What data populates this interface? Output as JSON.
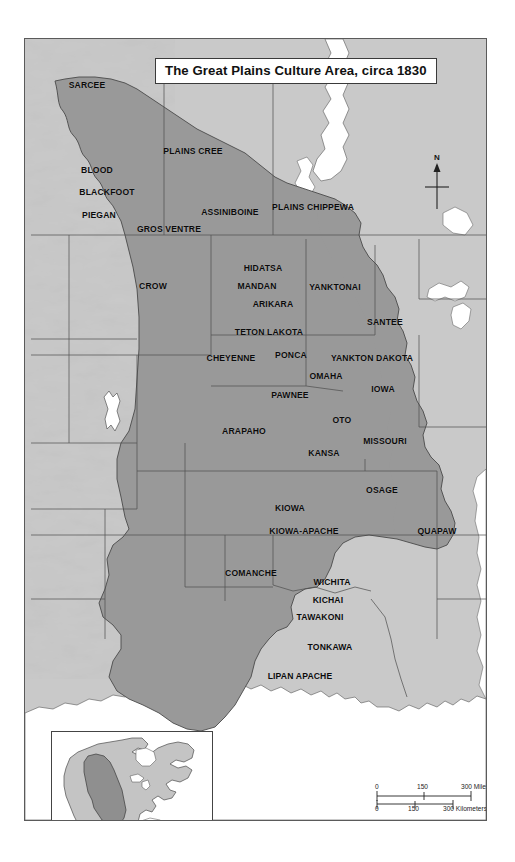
{
  "map": {
    "title": "The Great Plains Culture Area, circa 1830",
    "compass": {
      "north_label": "N",
      "icon": "north-arrow-icon"
    },
    "colors": {
      "culture_area_fill": "#999999",
      "land_fill": "#c9c9c9",
      "water_fill": "#ffffff",
      "border_stroke": "#5a5a5a",
      "label_text": "#0b0b0b",
      "inset_highlight": "#8f8f8f"
    },
    "scale_bar": {
      "miles": {
        "unit": "Miles",
        "ticks": [
          "0",
          "150",
          "300"
        ],
        "label": "300 Miles"
      },
      "kilometers": {
        "unit": "Kilometers",
        "ticks": [
          "0",
          "150",
          "300"
        ],
        "label": "300 Kilometers"
      }
    },
    "inset": {
      "name": "north-america-locator",
      "description": "North America locator with Great Plains highlighted"
    },
    "tribes": [
      {
        "name": "SARCEE",
        "x": 86,
        "y": 84
      },
      {
        "name": "PLAINS CREE",
        "x": 192,
        "y": 150
      },
      {
        "name": "BLOOD",
        "x": 96,
        "y": 169
      },
      {
        "name": "BLACKFOOT",
        "x": 106,
        "y": 191
      },
      {
        "name": "PIEGAN",
        "x": 98,
        "y": 214
      },
      {
        "name": "ASSINIBOINE",
        "x": 229,
        "y": 211
      },
      {
        "name": "PLAINS CHIPPEWA",
        "x": 312,
        "y": 206
      },
      {
        "name": "GROS VENTRE",
        "x": 168,
        "y": 228
      },
      {
        "name": "CROW",
        "x": 152,
        "y": 285
      },
      {
        "name": "HIDATSA",
        "x": 262,
        "y": 267
      },
      {
        "name": "MANDAN",
        "x": 256,
        "y": 285
      },
      {
        "name": "YANKTONAI",
        "x": 334,
        "y": 286
      },
      {
        "name": "ARIKARA",
        "x": 272,
        "y": 303
      },
      {
        "name": "TETON LAKOTA",
        "x": 268,
        "y": 331
      },
      {
        "name": "SANTEE",
        "x": 384,
        "y": 321
      },
      {
        "name": "CHEYENNE",
        "x": 230,
        "y": 357
      },
      {
        "name": "PONCA",
        "x": 290,
        "y": 354
      },
      {
        "name": "YANKTON DAKOTA",
        "x": 371,
        "y": 357
      },
      {
        "name": "OMAHA",
        "x": 325,
        "y": 375
      },
      {
        "name": "IOWA",
        "x": 382,
        "y": 388
      },
      {
        "name": "PAWNEE",
        "x": 289,
        "y": 394
      },
      {
        "name": "OTO",
        "x": 341,
        "y": 419
      },
      {
        "name": "ARAPAHO",
        "x": 243,
        "y": 430
      },
      {
        "name": "MISSOURI",
        "x": 384,
        "y": 440
      },
      {
        "name": "KANSA",
        "x": 323,
        "y": 452
      },
      {
        "name": "OSAGE",
        "x": 381,
        "y": 489
      },
      {
        "name": "KIOWA",
        "x": 289,
        "y": 507
      },
      {
        "name": "KIOWA-APACHE",
        "x": 303,
        "y": 530
      },
      {
        "name": "QUAPAW",
        "x": 436,
        "y": 530
      },
      {
        "name": "COMANCHE",
        "x": 250,
        "y": 572
      },
      {
        "name": "WICHITA",
        "x": 331,
        "y": 581
      },
      {
        "name": "KICHAI",
        "x": 327,
        "y": 599
      },
      {
        "name": "TAWAKONI",
        "x": 319,
        "y": 616
      },
      {
        "name": "TONKAWA",
        "x": 329,
        "y": 646
      },
      {
        "name": "LIPAN APACHE",
        "x": 299,
        "y": 675
      }
    ]
  }
}
